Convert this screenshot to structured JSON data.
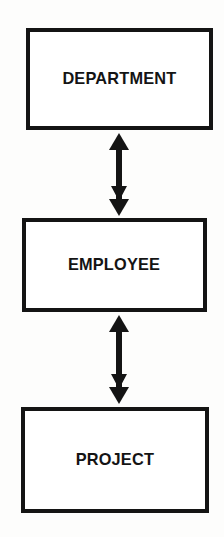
{
  "diagram": {
    "type": "entity-relationship-block-diagram",
    "title": "",
    "background_color": "#fdfdfc",
    "line_color": "#141414",
    "fill_color": "#ffffff",
    "entities": [
      {
        "id": "department",
        "label": "DEPARTMENT",
        "x": 26,
        "y": 28,
        "width": 187,
        "height": 102
      },
      {
        "id": "employee",
        "label": "EMPLOYEE",
        "x": 22,
        "y": 218,
        "width": 185,
        "height": 94
      },
      {
        "id": "project",
        "label": "PROJECT",
        "x": 21,
        "y": 407,
        "width": 188,
        "height": 106
      }
    ],
    "connectors": [
      {
        "id": "department-employee",
        "from": "department",
        "to": "employee",
        "arrowheads": "both",
        "orientation": "vertical",
        "center_x": 119,
        "top_y": 133,
        "bottom_y": 216
      },
      {
        "id": "employee-project",
        "from": "employee",
        "to": "project",
        "arrowheads": "both",
        "orientation": "vertical",
        "center_x": 119,
        "top_y": 315,
        "bottom_y": 404
      }
    ]
  }
}
